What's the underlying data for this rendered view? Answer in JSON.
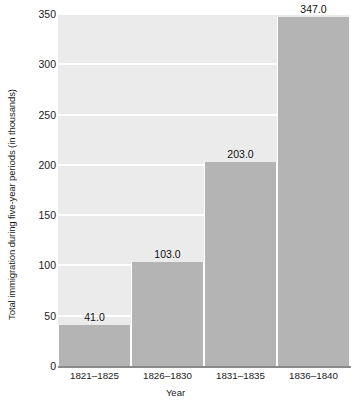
{
  "chart_data": {
    "type": "bar",
    "title": "",
    "xlabel": "Year",
    "ylabel": "Total immigration during five-year periods (in thousands)",
    "categories": [
      "1821–1825",
      "1826–1830",
      "1831–1835",
      "1836–1840"
    ],
    "values": [
      41.0,
      103.0,
      203.0,
      347.0
    ],
    "value_labels": [
      "41.0",
      "103.0",
      "203.0",
      "347.0"
    ],
    "ylim": [
      0,
      350
    ],
    "yticks": [
      0,
      50,
      100,
      150,
      200,
      250,
      300,
      350
    ],
    "ytick_labels": [
      "0",
      "50",
      "100",
      "150",
      "200",
      "250",
      "300",
      "350"
    ],
    "grid": true,
    "legend": false,
    "colors": {
      "bar": "#b4b4b4",
      "plot_background": "#ebebeb",
      "gridline": "#ffffff",
      "axis_line": "#8a8a8a",
      "text": "#1a1a1a",
      "figure_background": "#ffffff"
    }
  }
}
